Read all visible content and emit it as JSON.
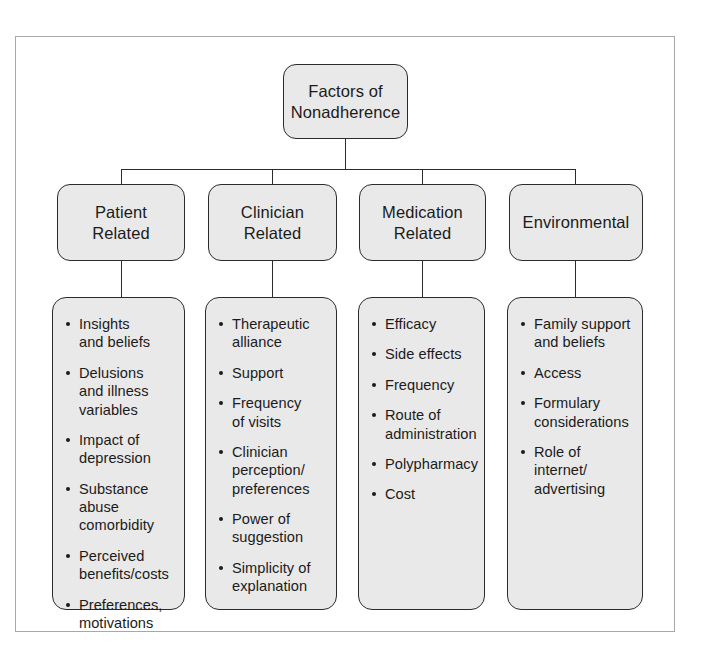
{
  "diagram": {
    "title": "Factors of Nonadherence",
    "root": {
      "label": "Factors of\nNonadherence"
    },
    "categories": [
      {
        "label": "Patient\nRelated",
        "items": [
          "Insights\nand beliefs",
          "Delusions\nand illness\nvariables",
          "Impact of\ndepression",
          "Substance\nabuse\ncomorbidity",
          "Perceived\nbenefits/costs",
          "Preferences,\nmotivations"
        ]
      },
      {
        "label": "Clinician\nRelated",
        "items": [
          "Therapeutic\nalliance",
          "Support",
          "Frequency\nof visits",
          "Clinician\nperception/\npreferences",
          "Power of\nsuggestion",
          "Simplicity of\nexplanation"
        ]
      },
      {
        "label": "Medication\nRelated",
        "items": [
          "Efficacy",
          "Side effects",
          "Frequency",
          "Route of\nadministration",
          "Polypharmacy",
          "Cost"
        ]
      },
      {
        "label": "Environmental",
        "items": [
          "Family support\nand beliefs",
          "Access",
          "Formulary\nconsiderations",
          "Role of\ninternet/\nadvertising"
        ]
      }
    ],
    "colors": {
      "node_fill": "#e9e9e9",
      "node_border": "#2b2b2b",
      "frame_border": "#a8a8a8",
      "text": "#1b1b1b",
      "page_background": "#ffffff"
    }
  }
}
